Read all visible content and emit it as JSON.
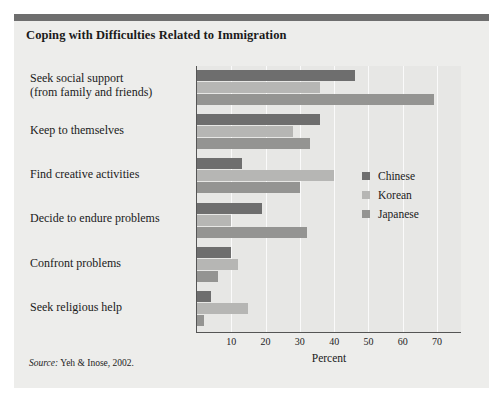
{
  "figure": {
    "title": "Coping with Difficulties Related to Immigration",
    "source_prefix": "Source:",
    "source_text": " Yeh & Inose, 2002."
  },
  "chart_data": {
    "type": "bar",
    "orientation": "horizontal",
    "title": "Coping with Difficulties Related to Immigration",
    "xlabel": "Percent",
    "ylabel": "",
    "xlim": [
      0,
      77
    ],
    "xticks": [
      10,
      20,
      30,
      40,
      50,
      60,
      70
    ],
    "grid": true,
    "legend_position": "center-right",
    "categories": [
      "Seek social support\n(from family and friends)",
      "Keep to themselves",
      "Find creative activities",
      "Decide to endure problems",
      "Confront problems",
      "Seek religious help"
    ],
    "series": [
      {
        "name": "Chinese",
        "color": "#6e6e6e",
        "values": [
          46,
          36,
          13,
          19,
          10,
          4
        ]
      },
      {
        "name": "Korean",
        "color": "#b6b6b4",
        "values": [
          36,
          28,
          40,
          10,
          12,
          15
        ]
      },
      {
        "name": "Japanese",
        "color": "#949492",
        "values": [
          69,
          33,
          30,
          32,
          6,
          2
        ]
      }
    ]
  }
}
